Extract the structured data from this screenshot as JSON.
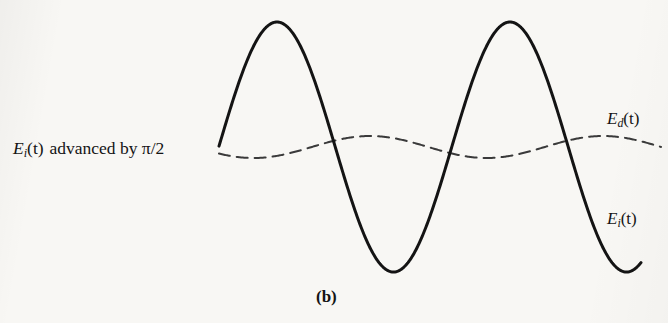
{
  "figure": {
    "caption": "(b)",
    "background_color": "#f7f6f3",
    "ink_color": "#141414",
    "left_annotation": {
      "symbol": "E",
      "subscript": "i",
      "argument": "(t)",
      "text": "advanced by",
      "phase": "π/2",
      "full_text": "E_i(t) advanced by π/2"
    },
    "curve_labels": {
      "dashed": {
        "symbol": "E",
        "subscript": "d",
        "argument": "(t)",
        "full_text": "E_d(t)"
      },
      "solid": {
        "symbol": "E",
        "subscript": "i",
        "argument": "(t)",
        "full_text": "E_i(t)"
      }
    }
  },
  "chart_data": {
    "type": "line",
    "title": "(b)",
    "xlabel": "",
    "ylabel": "",
    "grid": false,
    "axes_visible": false,
    "legend": "inline-labels-right",
    "baseline_y": 147,
    "x_range": [
      219,
      661
    ],
    "series": [
      {
        "name": "E_i(t)",
        "label": "E_i(t)",
        "style": "solid",
        "color": "#141414",
        "line_width": 3.0,
        "amplitude": 125,
        "period": 233,
        "phase_note": "advanced, starts rising from baseline at left edge",
        "x_start": 219,
        "x_end": 641,
        "key_points": [
          {
            "x": 219,
            "y": 150,
            "kind": "start"
          },
          {
            "x": 277,
            "y": 22,
            "kind": "peak"
          },
          {
            "x": 330,
            "y": 147,
            "kind": "zero-crossing"
          },
          {
            "x": 388,
            "y": 270,
            "kind": "trough"
          },
          {
            "x": 446,
            "y": 147,
            "kind": "zero-crossing"
          },
          {
            "x": 507,
            "y": 22,
            "kind": "peak"
          },
          {
            "x": 562,
            "y": 147,
            "kind": "zero-crossing"
          },
          {
            "x": 616,
            "y": 270,
            "kind": "trough"
          },
          {
            "x": 641,
            "y": 240,
            "kind": "end"
          }
        ]
      },
      {
        "name": "E_d(t)",
        "label": "E_d(t)",
        "style": "dashed",
        "color": "#3a3a3a",
        "line_width": 2.0,
        "dash_pattern": [
          11,
          7
        ],
        "amplitude": 11,
        "period": 233,
        "phase_note": "quarter-cycle retarded relative to E_i(t), small amplitude",
        "x_start": 219,
        "x_end": 661,
        "key_points": [
          {
            "x": 219,
            "y": 150,
            "kind": "start"
          },
          {
            "x": 255,
            "y": 158,
            "kind": "trough"
          },
          {
            "x": 312,
            "y": 147,
            "kind": "zero-crossing"
          },
          {
            "x": 370,
            "y": 137,
            "kind": "crest"
          },
          {
            "x": 430,
            "y": 147,
            "kind": "zero-crossing"
          },
          {
            "x": 490,
            "y": 158,
            "kind": "trough"
          },
          {
            "x": 545,
            "y": 147,
            "kind": "zero-crossing"
          },
          {
            "x": 600,
            "y": 137,
            "kind": "crest"
          },
          {
            "x": 661,
            "y": 142,
            "kind": "end"
          }
        ]
      }
    ]
  }
}
